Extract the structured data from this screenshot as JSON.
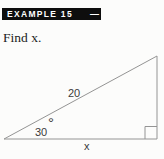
{
  "colors": {
    "page_bg": "#fcfcfb",
    "banner_bg": "#0e0e0e",
    "banner_text": "#ffffff",
    "figure_line": "#949494",
    "figure_text": "#3a3a3a",
    "prompt_text": "#1d1d1d"
  },
  "header": {
    "label": "EXAMPLE 15",
    "dash": "—"
  },
  "prompt": {
    "text": "Find x."
  },
  "figure": {
    "type": "right-triangle",
    "hypotenuse_label": "20",
    "angle_value": "30",
    "degree_symbol": "°",
    "base_label": "x",
    "right_angle_marker": true,
    "vertices": {
      "bottom_left": [
        4,
        139
      ],
      "top_right": [
        157,
        56
      ],
      "bottom_right": [
        157,
        139
      ]
    }
  }
}
